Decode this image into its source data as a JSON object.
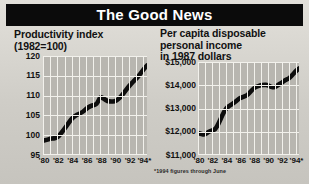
{
  "masthead": {
    "title": "The Good News"
  },
  "colors": {
    "background": "#d5d3cd",
    "masthead_bg": "#0b0b0b",
    "masthead_text": "#ffffff",
    "plot_bg": "#b8b6b0",
    "gridline": "#f2f1ec",
    "series_line": "#0d0d0d",
    "text": "#111111"
  },
  "footnote": {
    "text": "*1994 figures through June"
  },
  "chart_data": [
    {
      "id": "productivity",
      "type": "line",
      "title": "Productivity index\n(1982=100)",
      "xlabel": "",
      "ylabel": "",
      "ylim": [
        95,
        120
      ],
      "xlim": [
        1980,
        1994.5
      ],
      "grid": true,
      "legend": "none",
      "yticks": [
        "120",
        "115",
        "110",
        "105",
        "100",
        "95"
      ],
      "ytick_values": [
        120,
        115,
        110,
        105,
        100,
        95
      ],
      "xticks": [
        "'80",
        "'82",
        "'84",
        "'86",
        "'88",
        "'90",
        "'92",
        "'94*"
      ],
      "xtick_values": [
        1980,
        1982,
        1984,
        1986,
        1988,
        1990,
        1992,
        1994
      ],
      "x": [
        1980,
        1980.5,
        1981,
        1981.5,
        1982,
        1982.5,
        1983,
        1983.5,
        1984,
        1984.5,
        1985,
        1985.5,
        1986,
        1986.5,
        1987,
        1987.5,
        1988,
        1988.5,
        1989,
        1989.5,
        1990,
        1990.5,
        1991,
        1991.5,
        1992,
        1992.5,
        1993,
        1993.5,
        1994,
        1994.5
      ],
      "values": [
        98.6,
        98.8,
        99.1,
        99.2,
        99.4,
        100.4,
        101.6,
        102.9,
        104.2,
        104.9,
        105.4,
        105.8,
        106.6,
        107.3,
        107.6,
        107.8,
        109.8,
        109.2,
        108.6,
        108.5,
        108.5,
        109.1,
        110.0,
        111.2,
        112.4,
        113.4,
        114.3,
        115.3,
        116.6,
        117.6
      ]
    },
    {
      "id": "disposable-income",
      "type": "line",
      "title": "Per capita disposable\npersonal income\nin 1987 dollars",
      "xlabel": "",
      "ylabel": "",
      "ylim": [
        11000,
        15000
      ],
      "xlim": [
        1980,
        1994.5
      ],
      "grid": true,
      "legend": "none",
      "yticks": [
        "$15,000",
        "$14,000",
        "$13,000",
        "$12,000",
        "$11,000"
      ],
      "ytick_values": [
        15000,
        14000,
        13000,
        12000,
        11000
      ],
      "xticks": [
        "'80",
        "'82",
        "'84",
        "'86",
        "'88",
        "'90",
        "'92",
        "'94*"
      ],
      "xtick_values": [
        1980,
        1982,
        1984,
        1986,
        1988,
        1990,
        1992,
        1994
      ],
      "x": [
        1980,
        1980.5,
        1981,
        1981.5,
        1982,
        1982.5,
        1983,
        1983.5,
        1984,
        1984.5,
        1985,
        1985.5,
        1986,
        1986.5,
        1987,
        1987.5,
        1988,
        1988.5,
        1989,
        1989.5,
        1990,
        1990.5,
        1991,
        1991.5,
        1992,
        1992.5,
        1993,
        1993.5,
        1994,
        1994.5
      ],
      "values": [
        11950,
        11900,
        11870,
        12000,
        12050,
        12100,
        12380,
        12720,
        13000,
        13120,
        13200,
        13330,
        13450,
        13500,
        13560,
        13700,
        13880,
        13950,
        14000,
        14020,
        14010,
        13930,
        13900,
        14020,
        14100,
        14220,
        14280,
        14420,
        14600,
        14720
      ]
    }
  ]
}
